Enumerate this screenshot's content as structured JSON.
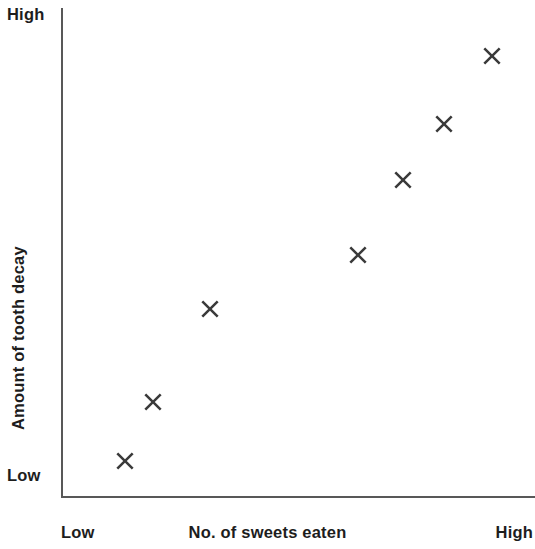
{
  "chart_data": {
    "type": "scatter",
    "title": "",
    "xlabel": "No. of sweets eaten",
    "ylabel": "Amount of tooth decay",
    "x_tick_labels": [
      "Low",
      "High"
    ],
    "y_tick_labels": [
      "Low",
      "High"
    ],
    "xlim": [
      "Low",
      "High"
    ],
    "ylim": [
      "Low",
      "High"
    ],
    "grid": false,
    "legend": null,
    "marker_symbol": "x-cross",
    "marker_color": "#3a3a3a",
    "axis_color": "#585858",
    "relationship": "positive correlation",
    "points": [
      {
        "x": 0.135,
        "y": 0.074
      },
      {
        "x": 0.194,
        "y": 0.195
      },
      {
        "x": 0.314,
        "y": 0.385
      },
      {
        "x": 0.627,
        "y": 0.495
      },
      {
        "x": 0.722,
        "y": 0.649
      },
      {
        "x": 0.809,
        "y": 0.763
      },
      {
        "x": 0.91,
        "y": 0.902
      }
    ],
    "points_px": [
      {
        "cx": 125,
        "cy": 461
      },
      {
        "cx": 153,
        "cy": 402
      },
      {
        "cx": 210,
        "cy": 309
      },
      {
        "cx": 358,
        "cy": 255
      },
      {
        "cx": 403,
        "cy": 180
      },
      {
        "cx": 444,
        "cy": 124
      },
      {
        "cx": 492,
        "cy": 56
      }
    ]
  },
  "axes": {
    "y_high_label": "High",
    "y_low_label": "Low",
    "y_title": "Amount of tooth decay",
    "x_low_label": "Low",
    "x_high_label": "High",
    "x_title": "No. of sweets eaten"
  }
}
